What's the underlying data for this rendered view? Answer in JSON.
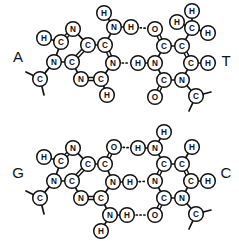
{
  "figure": {
    "background_color": "#ffffff",
    "line_color": "#111111",
    "width": 239,
    "height": 241
  },
  "base_labels": [
    {
      "id": "label-a",
      "text": "A",
      "name": "adenine",
      "x": 18,
      "y": 56
    },
    {
      "id": "label-t",
      "text": "T",
      "name": "thymine",
      "x": 226,
      "y": 60
    },
    {
      "id": "label-g",
      "text": "G",
      "name": "guanine",
      "x": 18,
      "y": 172
    },
    {
      "id": "label-c",
      "text": "C",
      "name": "cytosine",
      "x": 226,
      "y": 172
    }
  ],
  "pairs": [
    {
      "id": "pair-at",
      "name": "adenine-thymine-pair",
      "hydrogen_bond_count": 2,
      "atoms": [
        {
          "id": "a-h8",
          "el": "H",
          "x": 44,
          "y": 38
        },
        {
          "id": "a-c8",
          "el": "C",
          "x": 61,
          "y": 42
        },
        {
          "id": "a-n7",
          "el": "N",
          "x": 73,
          "y": 29
        },
        {
          "id": "a-c5",
          "el": "C",
          "x": 88,
          "y": 45
        },
        {
          "id": "a-c6",
          "el": "C",
          "x": 105,
          "y": 45
        },
        {
          "id": "a-n6",
          "el": "N",
          "x": 114,
          "y": 27
        },
        {
          "id": "a-h61",
          "el": "H",
          "x": 104,
          "y": 13
        },
        {
          "id": "a-h62",
          "el": "H",
          "x": 131,
          "y": 27
        },
        {
          "id": "a-n1",
          "el": "N",
          "x": 113,
          "y": 63
        },
        {
          "id": "a-c2",
          "el": "C",
          "x": 101,
          "y": 79
        },
        {
          "id": "a-h2",
          "el": "H",
          "x": 107,
          "y": 95
        },
        {
          "id": "a-n3",
          "el": "N",
          "x": 81,
          "y": 79
        },
        {
          "id": "a-c4",
          "el": "C",
          "x": 72,
          "y": 62
        },
        {
          "id": "a-n9",
          "el": "N",
          "x": 54,
          "y": 62
        },
        {
          "id": "a-c1s",
          "el": "C",
          "x": 40,
          "y": 79
        }
      ],
      "bonds": [
        {
          "from": "a-h8",
          "to": "a-c8",
          "order": 1
        },
        {
          "from": "a-c8",
          "to": "a-n7",
          "order": 2
        },
        {
          "from": "a-n7",
          "to": "a-c5",
          "order": 1
        },
        {
          "from": "a-c5",
          "to": "a-c6",
          "order": 1
        },
        {
          "from": "a-c6",
          "to": "a-n6",
          "order": 1
        },
        {
          "from": "a-n6",
          "to": "a-h61",
          "order": 1
        },
        {
          "from": "a-n6",
          "to": "a-h62",
          "order": 1
        },
        {
          "from": "a-c6",
          "to": "a-n1",
          "order": 2
        },
        {
          "from": "a-n1",
          "to": "a-c2",
          "order": 1
        },
        {
          "from": "a-c2",
          "to": "a-h2",
          "order": 1
        },
        {
          "from": "a-c2",
          "to": "a-n3",
          "order": 2
        },
        {
          "from": "a-n3",
          "to": "a-c4",
          "order": 1
        },
        {
          "from": "a-c4",
          "to": "a-c5",
          "order": 2
        },
        {
          "from": "a-c4",
          "to": "a-n9",
          "order": 1
        },
        {
          "from": "a-n9",
          "to": "a-c8",
          "order": 1
        },
        {
          "from": "a-n9",
          "to": "a-c1s",
          "order": 1
        }
      ],
      "stubs": [
        {
          "from": "a-c1s",
          "dx": -14,
          "dy": -7
        },
        {
          "from": "a-c1s",
          "dx": 4,
          "dy": 16
        }
      ],
      "partner_atoms": [
        {
          "id": "t-o4",
          "el": "O",
          "x": 155,
          "y": 29
        },
        {
          "id": "t-c4",
          "el": "C",
          "x": 164,
          "y": 46
        },
        {
          "id": "t-c5",
          "el": "C",
          "x": 182,
          "y": 46
        },
        {
          "id": "t-c7",
          "el": "C",
          "x": 192,
          "y": 28
        },
        {
          "id": "t-h71",
          "el": "H",
          "x": 177,
          "y": 22
        },
        {
          "id": "t-h72",
          "el": "H",
          "x": 192,
          "y": 11
        },
        {
          "id": "t-h73",
          "el": "H",
          "x": 208,
          "y": 33
        },
        {
          "id": "t-c6",
          "el": "C",
          "x": 191,
          "y": 63
        },
        {
          "id": "t-h6",
          "el": "H",
          "x": 208,
          "y": 63
        },
        {
          "id": "t-n1",
          "el": "N",
          "x": 182,
          "y": 80
        },
        {
          "id": "t-c1s",
          "el": "C",
          "x": 196,
          "y": 96
        },
        {
          "id": "t-c2",
          "el": "C",
          "x": 164,
          "y": 80
        },
        {
          "id": "t-o2",
          "el": "O",
          "x": 155,
          "y": 97
        },
        {
          "id": "t-n3",
          "el": "N",
          "x": 155,
          "y": 63
        },
        {
          "id": "t-h3",
          "el": "H",
          "x": 138,
          "y": 63
        }
      ],
      "partner_bonds": [
        {
          "from": "t-o4",
          "to": "t-c4",
          "order": 2
        },
        {
          "from": "t-c4",
          "to": "t-c5",
          "order": 1
        },
        {
          "from": "t-c5",
          "to": "t-c7",
          "order": 1
        },
        {
          "from": "t-c7",
          "to": "t-h71",
          "order": 1
        },
        {
          "from": "t-c7",
          "to": "t-h72",
          "order": 1
        },
        {
          "from": "t-c7",
          "to": "t-h73",
          "order": 1
        },
        {
          "from": "t-c5",
          "to": "t-c6",
          "order": 2
        },
        {
          "from": "t-c6",
          "to": "t-h6",
          "order": 1
        },
        {
          "from": "t-c6",
          "to": "t-n1",
          "order": 1
        },
        {
          "from": "t-n1",
          "to": "t-c1s",
          "order": 1
        },
        {
          "from": "t-n1",
          "to": "t-c2",
          "order": 1
        },
        {
          "from": "t-c2",
          "to": "t-o2",
          "order": 2
        },
        {
          "from": "t-c2",
          "to": "t-n3",
          "order": 1
        },
        {
          "from": "t-n3",
          "to": "t-c4",
          "order": 1
        },
        {
          "from": "t-n3",
          "to": "t-h3",
          "order": 1
        }
      ],
      "partner_stubs": [
        {
          "from": "t-c1s",
          "dx": 15,
          "dy": -4
        },
        {
          "from": "t-c1s",
          "dx": -7,
          "dy": 15
        }
      ],
      "hydrogen_bonds": [
        {
          "from": "a-h62",
          "to": "t-o4",
          "name": "hbond-n6h-o4"
        },
        {
          "from": "a-n1",
          "to": "t-h3",
          "name": "hbond-n1-h3n3"
        }
      ]
    },
    {
      "id": "pair-gc",
      "name": "guanine-cytosine-pair",
      "hydrogen_bond_count": 3,
      "atoms": [
        {
          "id": "g-h8",
          "el": "H",
          "x": 44,
          "y": 157
        },
        {
          "id": "g-c8",
          "el": "C",
          "x": 61,
          "y": 161
        },
        {
          "id": "g-n7",
          "el": "N",
          "x": 73,
          "y": 148
        },
        {
          "id": "g-c5",
          "el": "C",
          "x": 88,
          "y": 164
        },
        {
          "id": "g-c6",
          "el": "C",
          "x": 105,
          "y": 164
        },
        {
          "id": "g-o6",
          "el": "O",
          "x": 114,
          "y": 147
        },
        {
          "id": "g-n1",
          "el": "N",
          "x": 113,
          "y": 182
        },
        {
          "id": "g-h1",
          "el": "H",
          "x": 130,
          "y": 182
        },
        {
          "id": "g-c2",
          "el": "C",
          "x": 101,
          "y": 198
        },
        {
          "id": "g-n2",
          "el": "N",
          "x": 110,
          "y": 215
        },
        {
          "id": "g-h21",
          "el": "H",
          "x": 101,
          "y": 231
        },
        {
          "id": "g-h22",
          "el": "H",
          "x": 127,
          "y": 215
        },
        {
          "id": "g-n3",
          "el": "N",
          "x": 81,
          "y": 198
        },
        {
          "id": "g-c4",
          "el": "C",
          "x": 72,
          "y": 181
        },
        {
          "id": "g-n9",
          "el": "N",
          "x": 54,
          "y": 181
        },
        {
          "id": "g-c1s",
          "el": "C",
          "x": 40,
          "y": 198
        }
      ],
      "bonds": [
        {
          "from": "g-h8",
          "to": "g-c8",
          "order": 1
        },
        {
          "from": "g-c8",
          "to": "g-n7",
          "order": 2
        },
        {
          "from": "g-n7",
          "to": "g-c5",
          "order": 1
        },
        {
          "from": "g-c5",
          "to": "g-c6",
          "order": 1
        },
        {
          "from": "g-c6",
          "to": "g-o6",
          "order": 2
        },
        {
          "from": "g-c6",
          "to": "g-n1",
          "order": 1
        },
        {
          "from": "g-n1",
          "to": "g-h1",
          "order": 1
        },
        {
          "from": "g-n1",
          "to": "g-c2",
          "order": 1
        },
        {
          "from": "g-c2",
          "to": "g-n2",
          "order": 1
        },
        {
          "from": "g-n2",
          "to": "g-h21",
          "order": 1
        },
        {
          "from": "g-n2",
          "to": "g-h22",
          "order": 1
        },
        {
          "from": "g-c2",
          "to": "g-n3",
          "order": 2
        },
        {
          "from": "g-n3",
          "to": "g-c4",
          "order": 1
        },
        {
          "from": "g-c4",
          "to": "g-c5",
          "order": 2
        },
        {
          "from": "g-c4",
          "to": "g-n9",
          "order": 1
        },
        {
          "from": "g-n9",
          "to": "g-c8",
          "order": 1
        },
        {
          "from": "g-n9",
          "to": "g-c1s",
          "order": 1
        }
      ],
      "stubs": [
        {
          "from": "g-c1s",
          "dx": -14,
          "dy": -7
        },
        {
          "from": "g-c1s",
          "dx": 4,
          "dy": 16
        }
      ],
      "partner_atoms": [
        {
          "id": "c-h41",
          "el": "H",
          "x": 164,
          "y": 132
        },
        {
          "id": "c-n4",
          "el": "N",
          "x": 155,
          "y": 148
        },
        {
          "id": "c-h42",
          "el": "H",
          "x": 138,
          "y": 148
        },
        {
          "id": "c-c4",
          "el": "C",
          "x": 164,
          "y": 164
        },
        {
          "id": "c-c5",
          "el": "C",
          "x": 182,
          "y": 164
        },
        {
          "id": "c-h5",
          "el": "H",
          "x": 192,
          "y": 147
        },
        {
          "id": "c-c6",
          "el": "C",
          "x": 191,
          "y": 181
        },
        {
          "id": "c-h6",
          "el": "H",
          "x": 208,
          "y": 181
        },
        {
          "id": "c-n1",
          "el": "N",
          "x": 182,
          "y": 198
        },
        {
          "id": "c-c1s",
          "el": "C",
          "x": 196,
          "y": 214
        },
        {
          "id": "c-c2",
          "el": "C",
          "x": 164,
          "y": 198
        },
        {
          "id": "c-o2",
          "el": "O",
          "x": 155,
          "y": 215
        },
        {
          "id": "c-n3",
          "el": "N",
          "x": 155,
          "y": 181
        }
      ],
      "partner_bonds": [
        {
          "from": "c-h41",
          "to": "c-n4",
          "order": 1
        },
        {
          "from": "c-n4",
          "to": "c-h42",
          "order": 1
        },
        {
          "from": "c-n4",
          "to": "c-c4",
          "order": 1
        },
        {
          "from": "c-c4",
          "to": "c-c5",
          "order": 1
        },
        {
          "from": "c-c5",
          "to": "c-h5",
          "order": 1
        },
        {
          "from": "c-c5",
          "to": "c-c6",
          "order": 2
        },
        {
          "from": "c-c6",
          "to": "c-h6",
          "order": 1
        },
        {
          "from": "c-c6",
          "to": "c-n1",
          "order": 1
        },
        {
          "from": "c-n1",
          "to": "c-c1s",
          "order": 1
        },
        {
          "from": "c-n1",
          "to": "c-c2",
          "order": 1
        },
        {
          "from": "c-c2",
          "to": "c-o2",
          "order": 2
        },
        {
          "from": "c-c2",
          "to": "c-n3",
          "order": 1
        },
        {
          "from": "c-n3",
          "to": "c-c4",
          "order": 2
        }
      ],
      "partner_stubs": [
        {
          "from": "c-c1s",
          "dx": 15,
          "dy": -4
        },
        {
          "from": "c-c1s",
          "dx": -7,
          "dy": 15
        }
      ],
      "hydrogen_bonds": [
        {
          "from": "g-o6",
          "to": "c-h42",
          "name": "hbond-o6-h4n4"
        },
        {
          "from": "g-h1",
          "to": "c-n3",
          "name": "hbond-n1h-n3"
        },
        {
          "from": "g-h22",
          "to": "c-o2",
          "name": "hbond-n2h-o2"
        }
      ]
    }
  ]
}
